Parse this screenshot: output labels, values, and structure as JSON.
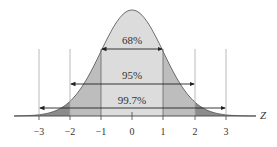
{
  "diagram": {
    "type": "normal-distribution-empirical-rule",
    "axis_label": "Z",
    "ticks": [
      {
        "value": -3,
        "label": "−3"
      },
      {
        "value": -2,
        "label": "−2"
      },
      {
        "value": -1,
        "label": "−1"
      },
      {
        "value": 0,
        "label": "0"
      },
      {
        "value": 1,
        "label": "1"
      },
      {
        "value": 2,
        "label": "2"
      },
      {
        "value": 3,
        "label": "3"
      }
    ],
    "intervals": [
      {
        "range": [
          -1,
          1
        ],
        "label": "68%"
      },
      {
        "range": [
          -2,
          2
        ],
        "label": "95%"
      },
      {
        "range": [
          -3,
          3
        ],
        "label": "99.7%"
      }
    ],
    "colors": {
      "inner_fill": "#dcdcdc",
      "middle_fill": "#bdbdbd",
      "outer_fill": "#8c8c8c",
      "line": "#333333",
      "guide": "#b0b0b0"
    }
  }
}
